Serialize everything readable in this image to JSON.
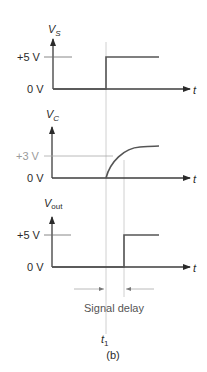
{
  "figure": {
    "caption": "(b)",
    "time_marker": {
      "label": "t",
      "subscript": "1"
    },
    "delay_label": "Signal delay",
    "colors": {
      "signal": "#555555",
      "axis": "#3c3c3c",
      "guide": "#c4c4c4",
      "text": "#2a2a2a",
      "light_text": "#9a9a9a"
    }
  },
  "plots": [
    {
      "name": "vs",
      "ylabel": {
        "main": "V",
        "sub": "S"
      },
      "xlabel": "t",
      "ticks": [
        {
          "label": "+5 V",
          "level": "high"
        },
        {
          "label": "0 V",
          "level": "zero"
        }
      ],
      "waveform": "step at t1"
    },
    {
      "name": "vc",
      "ylabel": {
        "main": "V",
        "sub": "C"
      },
      "xlabel": "t",
      "ticks": [
        {
          "label": "+3 V",
          "level": "threshold"
        },
        {
          "label": "0 V",
          "level": "zero"
        }
      ],
      "waveform": "exponential rise from t1"
    },
    {
      "name": "vout",
      "ylabel": {
        "main": "V",
        "sub": "out"
      },
      "xlabel": "t",
      "ticks": [
        {
          "label": "+5 V",
          "level": "high"
        },
        {
          "label": "0 V",
          "level": "zero"
        }
      ],
      "waveform": "step at t1 + delay"
    }
  ]
}
